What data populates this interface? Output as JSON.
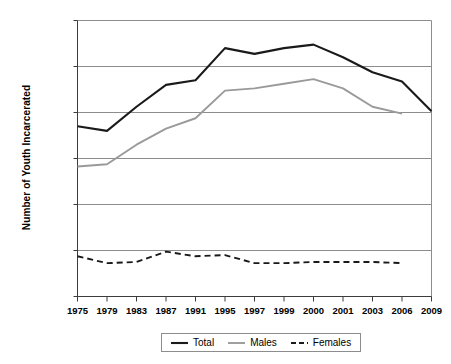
{
  "chart_data": {
    "type": "line",
    "title": "",
    "xlabel": "",
    "ylabel": "Number of Youth Incarcerated",
    "categories": [
      "1975",
      "1979",
      "1983",
      "1987",
      "1991",
      "1995",
      "1997",
      "1999",
      "2000",
      "2001",
      "2003",
      "2006",
      "2009"
    ],
    "ylim": [
      0,
      120000
    ],
    "ytick_labels": [
      "120,000",
      "100,000",
      "80,000",
      "60,000",
      "40,000",
      "20,000",
      "0"
    ],
    "ytick_values": [
      120000,
      100000,
      80000,
      60000,
      40000,
      20000,
      0
    ],
    "grid": "horizontal",
    "legend_position": "bottom-center",
    "series": [
      {
        "name": "Total",
        "color": "#1a1a1a",
        "style": "solid",
        "width": 2.1,
        "values": [
          74000,
          72000,
          82500,
          92000,
          94000,
          108000,
          105500,
          108000,
          109500,
          104000,
          97500,
          93500,
          80500
        ]
      },
      {
        "name": "Males",
        "color": "#9a9a9a",
        "style": "solid",
        "width": 1.9,
        "values": [
          56500,
          57500,
          66000,
          73000,
          77500,
          89500,
          90500,
          92500,
          94500,
          90500,
          82500,
          79500,
          null
        ]
      },
      {
        "name": "Females",
        "color": "#1a1a1a",
        "style": "dashed",
        "width": 1.9,
        "values": [
          17500,
          14500,
          15000,
          19500,
          17500,
          18000,
          14500,
          14500,
          15000,
          15000,
          15000,
          14500,
          null
        ]
      }
    ]
  },
  "legend": {
    "items": [
      {
        "label": "Total"
      },
      {
        "label": "Males"
      },
      {
        "label": "Females"
      }
    ]
  },
  "axes": {
    "y_title": "Number of Youth Incarcerated"
  }
}
